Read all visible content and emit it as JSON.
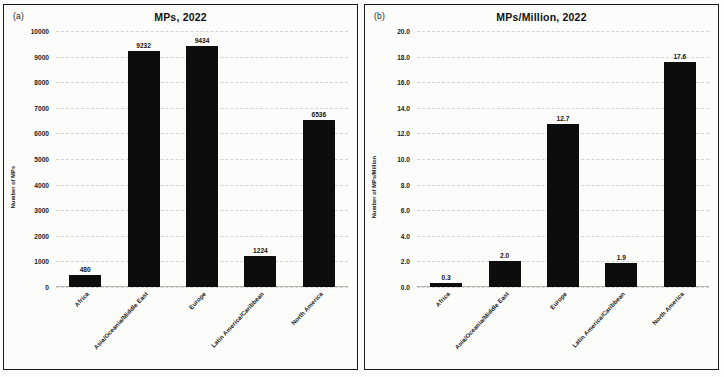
{
  "figure": {
    "background": "#fdfdfc",
    "bar_color": "#0d0d0d",
    "border_color": "#1a1a1a"
  },
  "panels": [
    {
      "tag": "(a)",
      "title": "MPs, 2022",
      "ylabel": "Number of MPs",
      "yticks": [
        "10000",
        "9000",
        "8000",
        "7000",
        "6000",
        "5000",
        "4000",
        "3000",
        "2000",
        "1000",
        "0"
      ],
      "categories": [
        "Africa",
        "Asia/Oceania/Middle East",
        "Europe",
        "Latin America/Caribbean",
        "North America"
      ],
      "bar_labels": [
        "480",
        "9232",
        "9434",
        "1224",
        "6536"
      ]
    },
    {
      "tag": "(b)",
      "title": "MPs/Million, 2022",
      "ylabel": "Number of MPs/Million",
      "yticks": [
        "20.0",
        "18.0",
        "16.0",
        "14.0",
        "12.0",
        "10.0",
        "8.0",
        "6.0",
        "4.0",
        "2.0",
        "0.0"
      ],
      "categories": [
        "Africa",
        "Asia/Oceania/Middle East",
        "Europe",
        "Latin America/Caribbean",
        "North America"
      ],
      "bar_labels": [
        "0.3",
        "2.0",
        "12.7",
        "1.9",
        "17.6"
      ]
    }
  ],
  "chart_data": [
    {
      "type": "bar",
      "title": "MPs, 2022",
      "panel": "(a)",
      "xlabel": "",
      "ylabel": "Number of MPs",
      "categories": [
        "Africa",
        "Asia/Oceania/Middle East",
        "Europe",
        "Latin America/Caribbean",
        "North America"
      ],
      "values": [
        480,
        9232,
        9434,
        1224,
        6536
      ],
      "ylim": [
        0,
        10000
      ],
      "ytick_step": 1000,
      "grid": true,
      "legend": "none",
      "data_labels": true
    },
    {
      "type": "bar",
      "title": "MPs/Million, 2022",
      "panel": "(b)",
      "xlabel": "",
      "ylabel": "Number of MPs/Million",
      "categories": [
        "Africa",
        "Asia/Oceania/Middle East",
        "Europe",
        "Latin America/Caribbean",
        "North America"
      ],
      "values": [
        0.3,
        2.0,
        12.7,
        1.9,
        17.6
      ],
      "ylim": [
        0,
        20
      ],
      "ytick_step": 2,
      "grid": true,
      "legend": "none",
      "data_labels": true
    }
  ]
}
